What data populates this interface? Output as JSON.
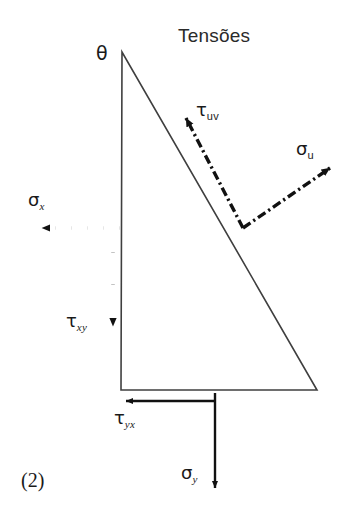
{
  "figure": {
    "title": "Tensões",
    "number": "(2)",
    "background_color": "#ffffff",
    "line_color": "#3a3a3a",
    "arrow_color": "#111111",
    "text_color": "#1a1a1a",
    "width": 355,
    "height": 521
  },
  "labels": {
    "theta": "θ",
    "tau_uv": {
      "symbol": "τ",
      "subscript": "uv"
    },
    "sigma_u": {
      "symbol": "σ",
      "subscript": "u"
    },
    "sigma_x": {
      "symbol": "σ",
      "subscript": "x"
    },
    "tau_xy": {
      "symbol": "τ",
      "subscript": "xy"
    },
    "tau_yx": {
      "symbol": "τ",
      "subscript": "yx"
    },
    "sigma_y": {
      "symbol": "σ",
      "subscript": "y"
    }
  },
  "shape": {
    "name": "right-triangle-element",
    "vertices": {
      "apex": [
        122,
        52
      ],
      "bottom_left": [
        121,
        390
      ],
      "bottom_right": [
        317,
        390
      ]
    }
  },
  "vectors": [
    {
      "name": "tau-uv-arrow",
      "label": "tau_uv",
      "style": "dash-dot",
      "from": [
        243,
        228
      ],
      "to": [
        184,
        115
      ],
      "direction": "up-left"
    },
    {
      "name": "sigma-u-arrow",
      "label": "sigma_u",
      "style": "dash-dot",
      "from": [
        243,
        228
      ],
      "to": [
        330,
        168
      ],
      "direction": "up-right"
    },
    {
      "name": "sigma-x-arrow",
      "label": "sigma_x",
      "style": "dotted",
      "from": [
        120,
        228
      ],
      "to": [
        33,
        228
      ],
      "direction": "left"
    },
    {
      "name": "tau-xy-arrow",
      "label": "tau_xy",
      "style": "dotted",
      "from": [
        113,
        232
      ],
      "to": [
        113,
        332
      ],
      "direction": "down"
    },
    {
      "name": "tau-yx-arrow",
      "label": "tau_yx",
      "style": "solid",
      "from": [
        216,
        401
      ],
      "to": [
        118,
        401
      ],
      "direction": "left"
    },
    {
      "name": "sigma-y-arrow",
      "label": "sigma_y",
      "style": "solid",
      "from": [
        215,
        393
      ],
      "to": [
        215,
        495
      ],
      "direction": "down"
    }
  ]
}
